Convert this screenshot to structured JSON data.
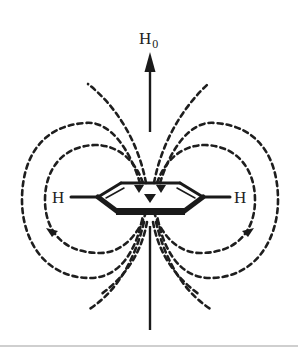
{
  "figure": {
    "labels": {
      "field": "H",
      "field_subscript": "0",
      "hydrogen_left": "H",
      "hydrogen_right": "H"
    },
    "colors": {
      "ink": "#1e1e1e",
      "background": "#ffffff",
      "rule": "#cfcfcf"
    }
  }
}
